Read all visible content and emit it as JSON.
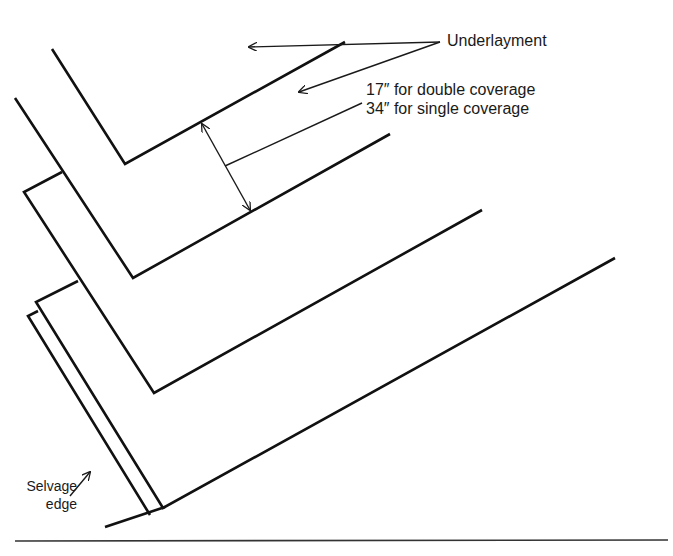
{
  "figure": {
    "labels": {
      "underlayment": "Underlayment",
      "coverage_line1": "17″ for double coverage",
      "coverage_line2": "34″ for single coverage",
      "selvage_line1": "Selvage",
      "selvage_line2": "edge"
    },
    "colors": {
      "line": "#111111",
      "background": "#ffffff",
      "text": "#1a1a1a"
    },
    "strips": [
      {
        "name": "underlayment-strip-1",
        "points": "52,49 125,164 345,42"
      },
      {
        "name": "underlayment-strip-2",
        "points": "15,98 133,278 390,134"
      },
      {
        "name": "underlayment-strip-3",
        "points": "62,172 24,192 154,393 482,210"
      },
      {
        "name": "underlayment-strip-4",
        "points": "78,281 36,302 163,508 615,258"
      },
      {
        "name": "selvage-strip",
        "points": "38,311 28,316 150,515"
      }
    ],
    "dimension": {
      "arrow_start": [
        202,
        124
      ],
      "arrow_end": [
        250,
        210
      ],
      "leader_start": [
        225,
        166
      ],
      "leader_end": [
        362,
        103
      ]
    },
    "leaders": {
      "underlayment_a": {
        "from": [
          440,
          42
        ],
        "to": [
          249,
          47
        ]
      },
      "underlayment_b": {
        "from": [
          440,
          42
        ],
        "to": [
          299,
          92
        ]
      },
      "selvage": {
        "from": [
          70,
          496
        ],
        "to": [
          90,
          472
        ]
      }
    },
    "rule_y": 541
  }
}
